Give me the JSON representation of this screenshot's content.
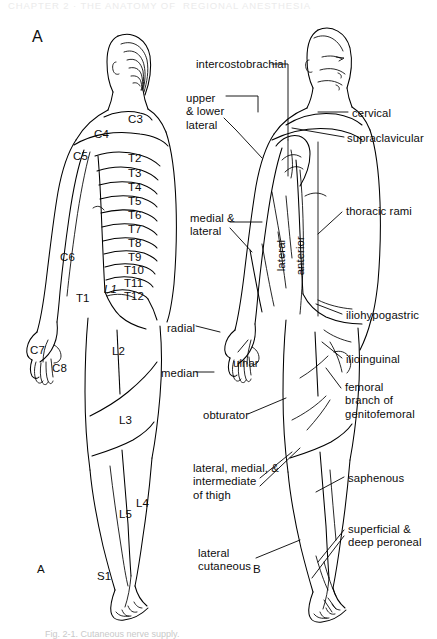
{
  "page": {
    "running_header": "CHAPTER 2 · THE ANATOMY OF  REGIONAL ANESTHESIA",
    "caption": "Fig. 2-1. Cutaneous nerve supply.",
    "background_color": "#ffffff",
    "ink_color": "#000000",
    "width": 437,
    "height": 639
  },
  "panels": {
    "a": {
      "label_top": "A",
      "label_bottom": "A",
      "title": "dermatomes"
    },
    "b": {
      "label_bottom": "B",
      "title": "peripheral cutaneous nerves"
    }
  },
  "dermatomes": [
    {
      "name": "C3",
      "text": "C3",
      "x": 128,
      "y": 113,
      "italic": false
    },
    {
      "name": "C4",
      "text": "C4",
      "x": 94,
      "y": 128,
      "italic": false
    },
    {
      "name": "C5",
      "text": "C5",
      "x": 73,
      "y": 150,
      "italic": false
    },
    {
      "name": "C6",
      "text": "C6",
      "x": 60,
      "y": 251,
      "italic": false
    },
    {
      "name": "C7",
      "text": "C7",
      "x": 30,
      "y": 344,
      "italic": false
    },
    {
      "name": "C8",
      "text": "C8",
      "x": 52,
      "y": 362,
      "italic": false
    },
    {
      "name": "T1",
      "text": "T1",
      "x": 76,
      "y": 292,
      "italic": false
    },
    {
      "name": "T2",
      "text": "T2",
      "x": 128,
      "y": 152,
      "italic": false
    },
    {
      "name": "T3",
      "text": "T3",
      "x": 128,
      "y": 167,
      "italic": false
    },
    {
      "name": "T4",
      "text": "T4",
      "x": 128,
      "y": 181,
      "italic": false
    },
    {
      "name": "T5",
      "text": "T5",
      "x": 128,
      "y": 195,
      "italic": false
    },
    {
      "name": "T6",
      "text": "T6",
      "x": 128,
      "y": 209,
      "italic": false
    },
    {
      "name": "T7",
      "text": "T7",
      "x": 128,
      "y": 223,
      "italic": false
    },
    {
      "name": "T8",
      "text": "T8",
      "x": 128,
      "y": 237,
      "italic": false
    },
    {
      "name": "T9",
      "text": "T9",
      "x": 128,
      "y": 251,
      "italic": false
    },
    {
      "name": "T10",
      "text": "T10",
      "x": 124,
      "y": 264,
      "italic": false
    },
    {
      "name": "T11",
      "text": "T11",
      "x": 124,
      "y": 277,
      "italic": false
    },
    {
      "name": "T12",
      "text": "T12",
      "x": 124,
      "y": 290,
      "italic": false
    },
    {
      "name": "L1",
      "text": "L1",
      "x": 104,
      "y": 283,
      "italic": true
    },
    {
      "name": "L2",
      "text": "L2",
      "x": 112,
      "y": 345,
      "italic": false
    },
    {
      "name": "L3",
      "text": "L3",
      "x": 119,
      "y": 414,
      "italic": false
    },
    {
      "name": "L4",
      "text": "L4",
      "x": 136,
      "y": 497,
      "italic": false
    },
    {
      "name": "L5",
      "text": "L5",
      "x": 119,
      "y": 508,
      "italic": false
    },
    {
      "name": "S1",
      "text": "S1",
      "x": 97,
      "y": 570,
      "italic": false
    }
  ],
  "nerves": [
    {
      "name": "intercostobrachial",
      "lines": [
        "intercostobrachial"
      ],
      "x": 196,
      "y": 58,
      "align": "left"
    },
    {
      "name": "upper-and-lower-lateral",
      "lines": [
        "upper",
        "& lower",
        "lateral"
      ],
      "x": 186,
      "y": 92,
      "align": "left"
    },
    {
      "name": "cervical",
      "lines": [
        "cervical"
      ],
      "x": 352,
      "y": 107,
      "align": "left"
    },
    {
      "name": "supraclavicular",
      "lines": [
        "supraclavicular"
      ],
      "x": 347,
      "y": 132,
      "align": "left"
    },
    {
      "name": "thoracic-rami",
      "lines": [
        "thoracic rami"
      ],
      "x": 346,
      "y": 205,
      "align": "left"
    },
    {
      "name": "medial-and-lateral",
      "lines": [
        "medial &",
        "lateral"
      ],
      "x": 190,
      "y": 212,
      "align": "left"
    },
    {
      "name": "radial",
      "lines": [
        "radial"
      ],
      "x": 167,
      "y": 322,
      "align": "left"
    },
    {
      "name": "median",
      "lines": [
        "median"
      ],
      "x": 161,
      "y": 367,
      "align": "left"
    },
    {
      "name": "ulnar",
      "lines": [
        "ulnar"
      ],
      "x": 233,
      "y": 357,
      "align": "left"
    },
    {
      "name": "iliohypogastric",
      "lines": [
        "iliohypogastric"
      ],
      "x": 346,
      "y": 309,
      "align": "left"
    },
    {
      "name": "ilioinguinal",
      "lines": [
        "ilioinguinal"
      ],
      "x": 346,
      "y": 353,
      "align": "left"
    },
    {
      "name": "femoral-branch-of-genitofemoral",
      "lines": [
        "femoral",
        "branch of",
        "genitofemoral"
      ],
      "x": 345,
      "y": 381,
      "align": "left"
    },
    {
      "name": "obturator",
      "lines": [
        "obturator"
      ],
      "x": 203,
      "y": 409,
      "align": "left"
    },
    {
      "name": "lateral-medial-intermediate-of-thigh",
      "lines": [
        "lateral, medial, &",
        "intermediate",
        "of thigh"
      ],
      "x": 193,
      "y": 462,
      "align": "left"
    },
    {
      "name": "saphenous",
      "lines": [
        "saphenous"
      ],
      "x": 348,
      "y": 472,
      "align": "left"
    },
    {
      "name": "superficial-and-deep-peroneal",
      "lines": [
        "superficial &",
        "deep peroneal"
      ],
      "x": 348,
      "y": 523,
      "align": "left"
    },
    {
      "name": "lateral-cutaneous",
      "lines": [
        "lateral",
        "cutaneous"
      ],
      "x": 198,
      "y": 547,
      "align": "left"
    }
  ],
  "rotated_nerves": [
    {
      "name": "lateral-trunk",
      "text": "lateral",
      "x": 288,
      "y": 258
    },
    {
      "name": "anterior-trunk",
      "text": "anterior",
      "x": 307,
      "y": 262
    }
  ]
}
